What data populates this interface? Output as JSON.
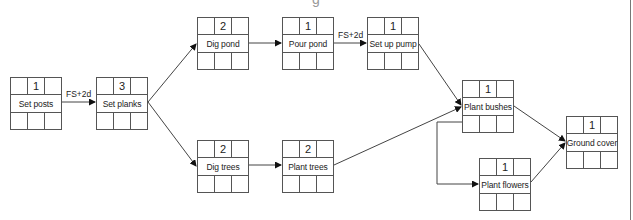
{
  "diagram": {
    "type": "precedence network",
    "top_clipped_text": "g",
    "nodes": [
      {
        "id": "set-posts",
        "name": "Set posts",
        "duration": "1",
        "x": 10,
        "y": 77
      },
      {
        "id": "set-planks",
        "name": "Set planks",
        "duration": "3",
        "x": 96,
        "y": 77
      },
      {
        "id": "dig-pond",
        "name": "Dig pond",
        "duration": "2",
        "x": 197,
        "y": 17
      },
      {
        "id": "pour-pond",
        "name": "Pour pond",
        "duration": "1",
        "x": 282,
        "y": 17
      },
      {
        "id": "set-up-pump",
        "name": "Set up pump",
        "duration": "1",
        "x": 367,
        "y": 17
      },
      {
        "id": "dig-trees",
        "name": "Dig trees",
        "duration": "2",
        "x": 197,
        "y": 140
      },
      {
        "id": "plant-trees",
        "name": "Plant trees",
        "duration": "2",
        "x": 282,
        "y": 140
      },
      {
        "id": "plant-bushes",
        "name": "Plant bushes",
        "duration": "1",
        "x": 462,
        "y": 80
      },
      {
        "id": "ground-cover",
        "name": "Ground cover",
        "duration": "1",
        "x": 566,
        "y": 116
      },
      {
        "id": "plant-flowers",
        "name": "Plant flowers",
        "duration": "1",
        "x": 479,
        "y": 158
      }
    ],
    "edges": [
      {
        "from": "set-posts",
        "to": "set-planks",
        "label": "FS+2d"
      },
      {
        "from": "set-planks",
        "to": "dig-pond",
        "label": ""
      },
      {
        "from": "set-planks",
        "to": "dig-trees",
        "label": ""
      },
      {
        "from": "dig-pond",
        "to": "pour-pond",
        "label": ""
      },
      {
        "from": "pour-pond",
        "to": "set-up-pump",
        "label": "FS+2d"
      },
      {
        "from": "set-up-pump",
        "to": "plant-bushes",
        "label": ""
      },
      {
        "from": "dig-trees",
        "to": "plant-trees",
        "label": ""
      },
      {
        "from": "plant-trees",
        "to": "plant-bushes",
        "label": ""
      },
      {
        "from": "plant-bushes",
        "to": "ground-cover",
        "label": ""
      },
      {
        "from": "plant-bushes",
        "to": "plant-flowers",
        "label": ""
      },
      {
        "from": "plant-flowers",
        "to": "ground-cover",
        "label": ""
      }
    ],
    "lag_labels": {
      "posts_to_planks": "FS+2d",
      "pour_to_pump": "FS+2d"
    }
  }
}
